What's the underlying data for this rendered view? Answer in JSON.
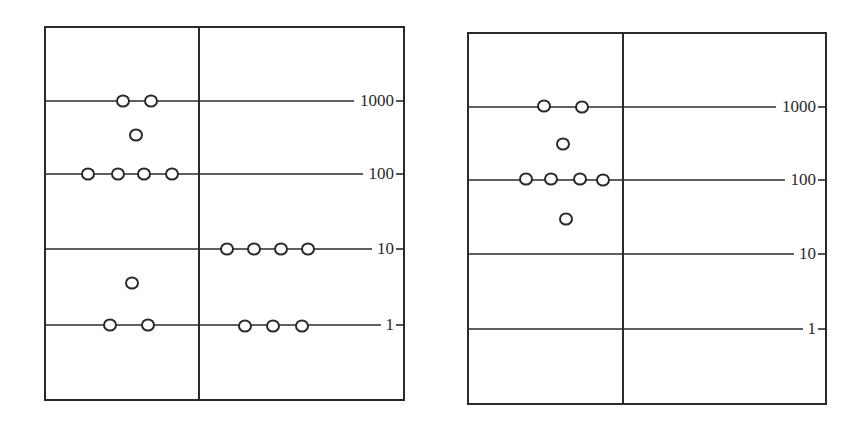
{
  "colors": {
    "ink": "#2a2a2a",
    "background": "#ffffff"
  },
  "panels": [
    {
      "id": "left",
      "frame": {
        "x1": 45,
        "y1": 27,
        "x2": 404,
        "y2": 400,
        "divider_x": 199
      },
      "levels": [
        {
          "label": "1000",
          "y": 101
        },
        {
          "label": "100",
          "y": 174
        },
        {
          "label": "10",
          "y": 249
        },
        {
          "label": "1",
          "y": 325
        }
      ],
      "circles": [
        {
          "x": 123,
          "y": 101,
          "level": "1000"
        },
        {
          "x": 151,
          "y": 101,
          "level": "1000"
        },
        {
          "x": 136,
          "y": 135,
          "level": "between 100 and 1000"
        },
        {
          "x": 88,
          "y": 174,
          "level": "100"
        },
        {
          "x": 118,
          "y": 174,
          "level": "100"
        },
        {
          "x": 144,
          "y": 174,
          "level": "100"
        },
        {
          "x": 172,
          "y": 174,
          "level": "100"
        },
        {
          "x": 227,
          "y": 249,
          "level": "10"
        },
        {
          "x": 254,
          "y": 249,
          "level": "10"
        },
        {
          "x": 281,
          "y": 249,
          "level": "10"
        },
        {
          "x": 308,
          "y": 249,
          "level": "10"
        },
        {
          "x": 132,
          "y": 283,
          "level": "between 1 and 10"
        },
        {
          "x": 110,
          "y": 325,
          "level": "1"
        },
        {
          "x": 148,
          "y": 325,
          "level": "1"
        },
        {
          "x": 245,
          "y": 326,
          "level": "1"
        },
        {
          "x": 273,
          "y": 326,
          "level": "1"
        },
        {
          "x": 302,
          "y": 326,
          "level": "1"
        }
      ]
    },
    {
      "id": "right",
      "frame": {
        "x1": 468,
        "y1": 33,
        "x2": 826,
        "y2": 404,
        "divider_x": 623
      },
      "levels": [
        {
          "label": "1000",
          "y": 107
        },
        {
          "label": "100",
          "y": 180
        },
        {
          "label": "10",
          "y": 254
        },
        {
          "label": "1",
          "y": 329
        }
      ],
      "circles": [
        {
          "x": 544,
          "y": 106,
          "level": "1000"
        },
        {
          "x": 582,
          "y": 107,
          "level": "1000"
        },
        {
          "x": 563,
          "y": 144,
          "level": "between 100 and 1000"
        },
        {
          "x": 526,
          "y": 179,
          "level": "100"
        },
        {
          "x": 551,
          "y": 179,
          "level": "100"
        },
        {
          "x": 580,
          "y": 179,
          "level": "100"
        },
        {
          "x": 603,
          "y": 180,
          "level": "100"
        },
        {
          "x": 566,
          "y": 219,
          "level": "between 10 and 100"
        }
      ]
    }
  ]
}
